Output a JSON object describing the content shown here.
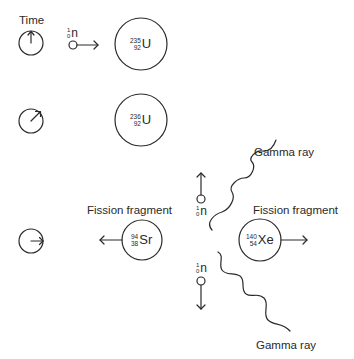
{
  "labels": {
    "time": "Time",
    "fission_fragment_left": "Fission fragment",
    "fission_fragment_right": "Fission fragment",
    "gamma_ray_top": "Gamma ray",
    "gamma_ray_bottom": "Gamma ray"
  },
  "nuclei": {
    "u235": {
      "mass": "235",
      "atomic": "92",
      "symbol": "U"
    },
    "u236": {
      "mass": "236",
      "atomic": "92",
      "symbol": "U"
    },
    "sr94": {
      "mass": "94",
      "atomic": "38",
      "symbol": "Sr"
    },
    "xe140": {
      "mass": "140",
      "atomic": "54",
      "symbol": "Xe"
    }
  },
  "neutrons": {
    "incoming": {
      "mass": "1",
      "atomic": "0",
      "symbol": "n"
    },
    "up": {
      "mass": "1",
      "atomic": "0",
      "symbol": "n"
    },
    "down": {
      "mass": "1",
      "atomic": "0",
      "symbol": "n"
    }
  },
  "clocks": [
    {
      "stage": 1,
      "hand": "up"
    },
    {
      "stage": 2,
      "hand": "up-right"
    },
    {
      "stage": 3,
      "hand": "right"
    }
  ],
  "colors": {
    "stroke": "#2a2a2a",
    "background": "#ffffff"
  }
}
